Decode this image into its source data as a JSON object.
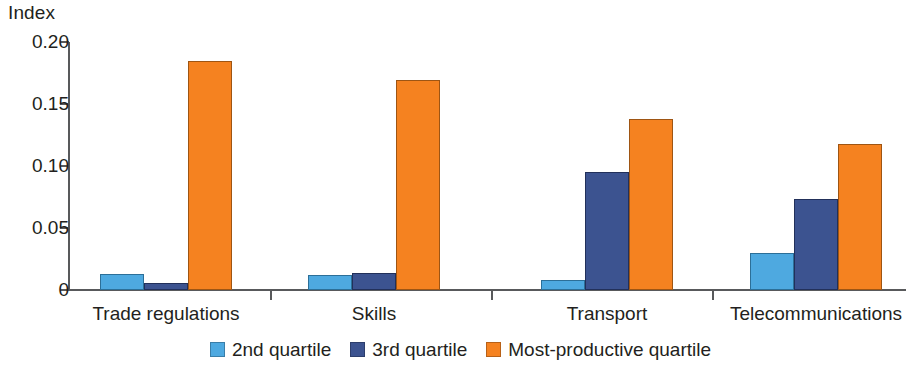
{
  "chart_data": {
    "type": "bar",
    "title": "",
    "xlabel": "",
    "ylabel": "Index",
    "ylim": [
      0,
      0.2
    ],
    "yticks": [
      "0",
      "0.05",
      "0.10",
      "0.15",
      "0.20"
    ],
    "ytick_values": [
      0,
      0.05,
      0.1,
      0.15,
      0.2
    ],
    "grid": false,
    "legend_position": "bottom-center",
    "categories": [
      "Trade regulations",
      "Skills",
      "Transport",
      "Telecommunications"
    ],
    "series": [
      {
        "name": "2nd quartile",
        "color": "#4ea9e0",
        "values": [
          0.013,
          0.012,
          0.008,
          0.03
        ]
      },
      {
        "name": "3rd quartile",
        "color": "#3c5390",
        "values": [
          0.006,
          0.014,
          0.095,
          0.073
        ]
      },
      {
        "name": "Most-productive quartile",
        "color": "#f58220",
        "values": [
          0.185,
          0.169,
          0.138,
          0.118
        ]
      }
    ]
  }
}
